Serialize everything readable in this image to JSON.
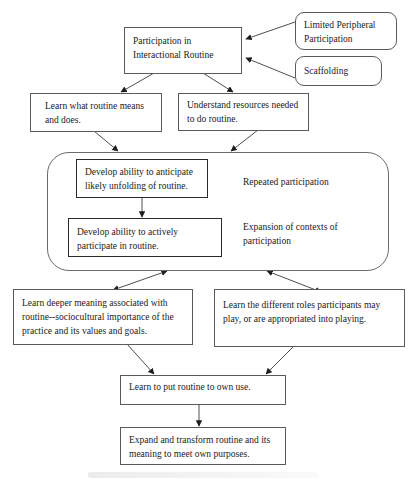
{
  "diagram": {
    "nodes": {
      "participation": {
        "text": "Participation in Interactional Routine"
      },
      "lpp": {
        "text": "Limited Peripheral Participation"
      },
      "scaffolding": {
        "text": "Scaffolding"
      },
      "learn_what": {
        "text": "Learn what routine means and does."
      },
      "understand_resources": {
        "text": "Understand resources needed to do routine."
      },
      "anticipate": {
        "text": "Develop ability to anticipate likely unfolding of routine."
      },
      "actively_participate": {
        "text": "Develop ability to actively participate in routine."
      },
      "deeper_meaning": {
        "text": "Learn deeper meaning associated with routine--sociocultural importance of the practice and its values and goals."
      },
      "different_roles": {
        "text": "Learn the different roles participants may play, or are appropriated into playing."
      },
      "own_use": {
        "text": "Learn to put routine to own use."
      },
      "expand_transform": {
        "text": "Expand and transform routine and its meaning to meet own purposes."
      }
    },
    "container_labels": {
      "repeated": "Repeated participation",
      "expansion": "Expansion of contexts of participation"
    },
    "edges": [
      {
        "from": "lpp",
        "to": "participation",
        "type": "arrow"
      },
      {
        "from": "scaffolding",
        "to": "participation",
        "type": "arrow"
      },
      {
        "from": "participation",
        "to": "learn_what",
        "type": "arrow"
      },
      {
        "from": "participation",
        "to": "understand_resources",
        "type": "arrow"
      },
      {
        "from": "learn_what",
        "to": "repeated_participation_container",
        "type": "arrow"
      },
      {
        "from": "understand_resources",
        "to": "repeated_participation_container",
        "type": "arrow"
      },
      {
        "from": "anticipate",
        "to": "actively_participate",
        "type": "arrow"
      },
      {
        "from": "repeated_participation_container",
        "to": "deeper_meaning",
        "type": "bidirectional"
      },
      {
        "from": "repeated_participation_container",
        "to": "different_roles",
        "type": "bidirectional"
      },
      {
        "from": "deeper_meaning",
        "to": "own_use",
        "type": "arrow"
      },
      {
        "from": "different_roles",
        "to": "own_use",
        "type": "arrow"
      },
      {
        "from": "own_use",
        "to": "expand_transform",
        "type": "arrow"
      }
    ]
  },
  "colors": {
    "line": "#3a3a3a",
    "border": "#5a5a5a",
    "text": "#1a1a1a",
    "background": "#ffffff"
  }
}
